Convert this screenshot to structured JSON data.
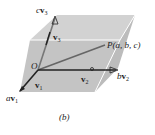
{
  "figure": {
    "caption": "(b)",
    "labels": {
      "origin": "O",
      "point": "P(a, b, c)",
      "v1": "v",
      "v1_sub": "1",
      "v2": "v",
      "v2_sub": "2",
      "v3": "v",
      "v3_sub": "3",
      "av1_coef": "a",
      "av1_vec": "v",
      "av1_sub": "1",
      "bv2_coef": "b",
      "bv2_vec": "v",
      "bv2_sub": "2",
      "cv3_coef": "c",
      "cv3_vec": "v",
      "cv3_sub": "3"
    },
    "colors": {
      "box_fill": "#c8c8c8",
      "box_top": "#d6d6d6",
      "edge": "#ffffff",
      "arrow": "#222222",
      "diagonal": "#666666"
    }
  }
}
